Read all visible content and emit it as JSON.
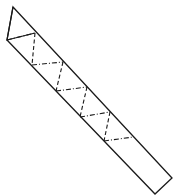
{
  "diagram": {
    "title": "",
    "stroke_color": "#1a1a1a",
    "background": "#ffffff",
    "outline": {
      "points": [
        [
          13,
          7
        ],
        [
          172,
          178
        ],
        [
          155,
          194
        ],
        [
          7,
          40
        ]
      ],
      "apex_fold": [
        [
          13,
          7
        ],
        [
          7,
          40
        ],
        [
          35,
          33
        ]
      ]
    },
    "dash_dot_creases": [
      [
        [
          7,
          40
        ],
        [
          35,
          33
        ]
      ],
      [
        [
          32,
          65
        ],
        [
          63,
          62
        ]
      ],
      [
        [
          56,
          91
        ],
        [
          87,
          87
        ]
      ],
      [
        [
          80,
          117
        ],
        [
          110,
          112
        ]
      ],
      [
        [
          104,
          141
        ],
        [
          133,
          137
        ]
      ]
    ],
    "dashed_creases": [
      [
        [
          35,
          33
        ],
        [
          32,
          65
        ]
      ],
      [
        [
          63,
          62
        ],
        [
          56,
          91
        ]
      ],
      [
        [
          87,
          87
        ],
        [
          80,
          117
        ]
      ],
      [
        [
          110,
          112
        ],
        [
          104,
          141
        ]
      ]
    ]
  }
}
